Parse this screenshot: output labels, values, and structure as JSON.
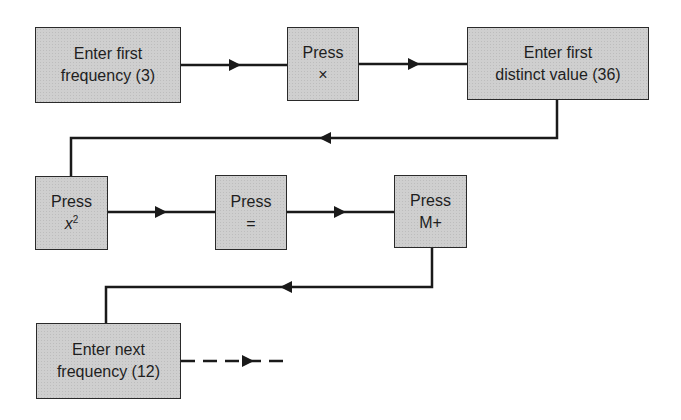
{
  "diagram": {
    "type": "flowchart",
    "nodes": [
      {
        "id": "n1",
        "line1": "Enter first",
        "line2": "frequency (3)"
      },
      {
        "id": "n2",
        "line1": "Press",
        "line2": "×"
      },
      {
        "id": "n3",
        "line1": "Enter first",
        "line2": "distinct value (36)"
      },
      {
        "id": "n4",
        "line1": "Press",
        "line2_base": "x",
        "line2_sup": "2"
      },
      {
        "id": "n5",
        "line1": "Press",
        "line2": "="
      },
      {
        "id": "n6",
        "line1": "Press",
        "line2": "M+"
      },
      {
        "id": "n7",
        "line1": "Enter next",
        "line2": "frequency (12)"
      }
    ],
    "edges": [
      {
        "from": "n1",
        "to": "n2",
        "style": "solid"
      },
      {
        "from": "n2",
        "to": "n3",
        "style": "solid"
      },
      {
        "from": "n3",
        "to": "n4",
        "style": "solid"
      },
      {
        "from": "n4",
        "to": "n5",
        "style": "solid"
      },
      {
        "from": "n5",
        "to": "n6",
        "style": "solid"
      },
      {
        "from": "n6",
        "to": "n7",
        "style": "solid"
      },
      {
        "from": "n7",
        "to": "continue",
        "style": "dashed"
      }
    ],
    "colors": {
      "box_fill": "#cfcfcf",
      "stroke": "#1a1a1a",
      "background": "#ffffff"
    }
  }
}
